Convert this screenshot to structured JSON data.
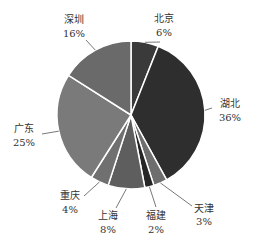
{
  "chart_data": {
    "type": "pie",
    "title": "",
    "categories": [
      "北京",
      "湖北",
      "天津",
      "福建",
      "上海",
      "重庆",
      "广东",
      "深圳"
    ],
    "values": [
      6,
      36,
      3,
      2,
      8,
      4,
      25,
      16
    ],
    "unit": "%",
    "colors": [
      "#3a3a3a",
      "#2e2e2e",
      "#6e6e6e",
      "#262626",
      "#5e5e5e",
      "#707070",
      "#7a7a7a",
      "#6a6a6a"
    ],
    "start_angle_deg": 0,
    "direction": "clockwise",
    "legend": "none",
    "labels": [
      {
        "name": "北京",
        "pct": "6%"
      },
      {
        "name": "湖北",
        "pct": "36%"
      },
      {
        "name": "天津",
        "pct": "3%"
      },
      {
        "name": "福建",
        "pct": "2%"
      },
      {
        "name": "上海",
        "pct": "8%"
      },
      {
        "name": "重庆",
        "pct": "4%"
      },
      {
        "name": "广东",
        "pct": "25%"
      },
      {
        "name": "深圳",
        "pct": "16%"
      }
    ]
  }
}
